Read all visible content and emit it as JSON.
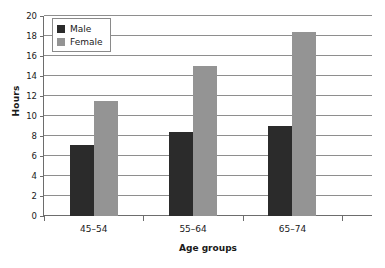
{
  "chart_data": {
    "type": "bar",
    "title": "",
    "subtitle": "",
    "xlabel": "Age groups",
    "ylabel": "Hours",
    "categories": [
      "45–54",
      "55–64",
      "65–74"
    ],
    "series": [
      {
        "name": "Male",
        "color": "#2b2b2b",
        "values": [
          7.1,
          8.4,
          9.0
        ]
      },
      {
        "name": "Female",
        "color": "#949494",
        "values": [
          11.5,
          15.0,
          18.4
        ]
      }
    ],
    "ylim": [
      0,
      20
    ],
    "ytick_step": 2,
    "yticks": [
      "0",
      "2",
      "4",
      "6",
      "8",
      "10",
      "12",
      "14",
      "16",
      "18",
      "20"
    ],
    "grid": "horizontal",
    "legend_position": "top-left-inside",
    "background_color": "#ffffff",
    "gridline_color": "#8e8e8e",
    "axis_color": "#6d6d6d"
  },
  "axes": {
    "y_title": "Hours",
    "x_title": "Age groups"
  },
  "legend": {
    "entries": [
      {
        "label": "Male"
      },
      {
        "label": "Female"
      }
    ]
  }
}
